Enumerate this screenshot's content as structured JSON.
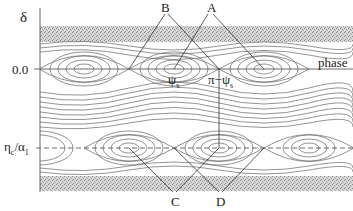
{
  "diagram": {
    "type": "phase-space separatrix diagram",
    "axis_labels": {
      "y": "δ",
      "x": "phase"
    },
    "y_ticks": [
      {
        "label": "0.0",
        "position": "upper_axis"
      },
      {
        "label": "η_c/α_1",
        "main": "η",
        "sub1": "c",
        "slash": "/α",
        "sub2": "1",
        "position": "lower_axis"
      }
    ],
    "point_labels": {
      "psi_s": "ψ",
      "psi_s_sub": "s",
      "pi_minus_psi": "π−ψ",
      "pi_minus_psi_sub": "s"
    },
    "callouts": [
      "A",
      "B",
      "C",
      "D"
    ],
    "colors": {
      "contour": "#555555",
      "axis": "#444444",
      "noise": "#9a9a9a",
      "background": "#ffffff"
    }
  }
}
